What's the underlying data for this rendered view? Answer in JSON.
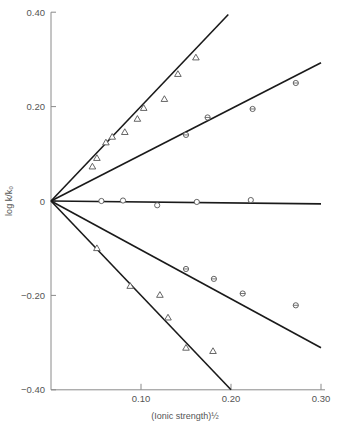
{
  "chart_data": {
    "type": "scatter",
    "title": "",
    "xlabel": "(Ionic strength)½",
    "ylabel": "log k/k₀",
    "xlim": [
      0,
      0.3
    ],
    "ylim": [
      -0.4,
      0.4
    ],
    "x_ticks": [
      0.1,
      0.2,
      0.3
    ],
    "x_tick_labels": [
      "0.10",
      "0.20",
      "0.30"
    ],
    "y_ticks": [
      0.4,
      0.2,
      0,
      -0.2,
      -0.4
    ],
    "y_tick_labels": [
      "0.40",
      "0.20",
      "0",
      "−0.20",
      "−0.40"
    ],
    "grid": false,
    "legend": null,
    "series": [
      {
        "name": "upper-triangles",
        "marker": "triangle",
        "points": [
          [
            0.046,
            0.073
          ],
          [
            0.051,
            0.091
          ],
          [
            0.061,
            0.124
          ],
          [
            0.068,
            0.136
          ],
          [
            0.082,
            0.146
          ],
          [
            0.096,
            0.174
          ],
          [
            0.103,
            0.197
          ],
          [
            0.126,
            0.216
          ],
          [
            0.141,
            0.269
          ],
          [
            0.161,
            0.304
          ]
        ]
      },
      {
        "name": "upper-barred-circles",
        "marker": "barred-circle",
        "points": [
          [
            0.15,
            0.14
          ],
          [
            0.174,
            0.177
          ],
          [
            0.224,
            0.195
          ],
          [
            0.272,
            0.25
          ]
        ]
      },
      {
        "name": "zero-open-circles",
        "marker": "circle",
        "points": [
          [
            0.056,
            0.0
          ],
          [
            0.08,
            0.001
          ],
          [
            0.118,
            -0.009
          ],
          [
            0.162,
            -0.002
          ],
          [
            0.222,
            0.002
          ]
        ]
      },
      {
        "name": "lower-barred-circles",
        "marker": "barred-circle",
        "points": [
          [
            0.15,
            -0.144
          ],
          [
            0.181,
            -0.165
          ],
          [
            0.213,
            -0.196
          ],
          [
            0.272,
            -0.221
          ]
        ]
      },
      {
        "name": "lower-triangles",
        "marker": "triangle",
        "points": [
          [
            0.051,
            -0.1
          ],
          [
            0.088,
            -0.18
          ],
          [
            0.121,
            -0.199
          ],
          [
            0.13,
            -0.247
          ],
          [
            0.15,
            -0.311
          ],
          [
            0.18,
            -0.318
          ]
        ]
      }
    ],
    "fit_lines": [
      {
        "name": "slope-+2",
        "from": [
          0,
          0
        ],
        "to": [
          0.197,
          0.395
        ]
      },
      {
        "name": "slope-+1",
        "from": [
          0,
          0
        ],
        "to": [
          0.3,
          0.293
        ]
      },
      {
        "name": "slope-0",
        "from": [
          0,
          0
        ],
        "to": [
          0.3,
          -0.006
        ]
      },
      {
        "name": "slope--1",
        "from": [
          0,
          0
        ],
        "to": [
          0.3,
          -0.311
        ]
      },
      {
        "name": "slope--2",
        "from": [
          0,
          0
        ],
        "to": [
          0.2,
          -0.4
        ]
      }
    ],
    "colors": {
      "axis": "#8a8a8a",
      "line": "#1a1a1a",
      "marker": "#555555",
      "text": "#555555"
    }
  }
}
